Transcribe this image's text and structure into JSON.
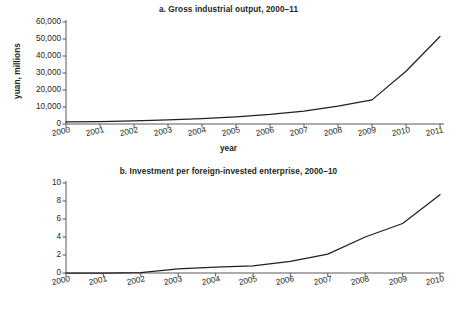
{
  "figure": {
    "background": "#ffffff",
    "line_color": "#231f20",
    "axis_color": "#58595b",
    "text_color": "#231f20"
  },
  "chart_data": [
    {
      "id": "a",
      "type": "line",
      "title": "a. Gross industrial output, 2000–11",
      "xlabel": "year",
      "ylabel": "yuan, millions",
      "grid": false,
      "legend": false,
      "x": [
        2000,
        2001,
        2002,
        2003,
        2004,
        2005,
        2006,
        2007,
        2008,
        2009,
        2010,
        2011
      ],
      "categories": [
        "2000",
        "2001",
        "2002",
        "2003",
        "2004",
        "2005",
        "2006",
        "2007",
        "2008",
        "2009",
        "2010",
        "2011"
      ],
      "values": [
        1200,
        1400,
        1800,
        2400,
        3200,
        4200,
        5600,
        7600,
        10500,
        14200,
        31000,
        51500
      ],
      "xlim": [
        2000,
        2011
      ],
      "ylim": [
        0,
        60000
      ],
      "yticks": [
        0,
        10000,
        20000,
        30000,
        40000,
        50000,
        60000
      ],
      "ytick_labels": [
        "0",
        "10,000",
        "20,000",
        "30,000",
        "40,000",
        "50,000",
        "60,000"
      ]
    },
    {
      "id": "b",
      "type": "line",
      "title": "b. Investment per foreign-invested enterprise, 2000–10",
      "xlabel": "year",
      "ylabel": "$, millions",
      "grid": false,
      "legend": false,
      "x": [
        2000,
        2001,
        2002,
        2003,
        2004,
        2005,
        2006,
        2007,
        2008,
        2009,
        2010
      ],
      "categories": [
        "2000",
        "2001",
        "2002",
        "2003",
        "2004",
        "2005",
        "2006",
        "2007",
        "2008",
        "2009",
        "2010"
      ],
      "values": [
        0.0,
        0.0,
        0.05,
        0.45,
        0.65,
        0.8,
        1.3,
        2.1,
        4.0,
        5.5,
        8.7
      ],
      "xlim": [
        2000,
        2010
      ],
      "ylim": [
        0,
        10
      ],
      "yticks": [
        0,
        2,
        4,
        6,
        8,
        10
      ],
      "ytick_labels": [
        "0",
        "2",
        "4",
        "6",
        "8",
        "10"
      ]
    }
  ]
}
